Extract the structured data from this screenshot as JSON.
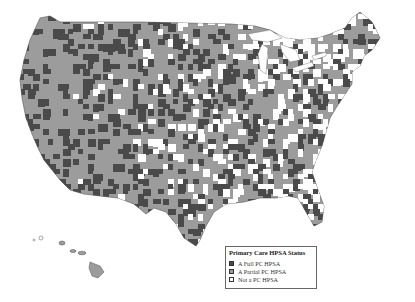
{
  "map": {
    "title": "Primary Care HPSA Status",
    "region": "United States (counties)",
    "colors": {
      "full": "#4a4a4a",
      "partial": "#9c9c9c",
      "none": "#ffffff",
      "border": "#555555",
      "background": "#ffffff"
    }
  },
  "legend": {
    "title": "Primary Care HPSA Status",
    "items": [
      {
        "label": "A Full PC HPSA",
        "color": "#4a4a4a"
      },
      {
        "label": "A Partial PC HPSA",
        "color": "#9c9c9c"
      },
      {
        "label": "Not a PC HPSA",
        "color": "#ffffff"
      }
    ]
  }
}
